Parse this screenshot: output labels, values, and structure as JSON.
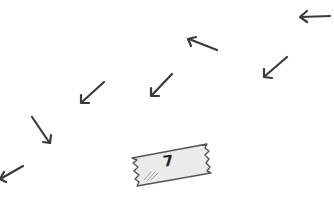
{
  "scene": {
    "background_color": "#ffffff",
    "stroke_color": "#3a3a3a",
    "tape_fill_color": "#ebebeb",
    "tape_outline_color": "#555555"
  },
  "arrows": [
    {
      "id": "arrow-1",
      "direction": "left",
      "x1": 330,
      "y1": 16,
      "x2": 300,
      "y2": 16
    },
    {
      "id": "arrow-2",
      "direction": "up-left",
      "x1": 217,
      "y1": 50,
      "x2": 188,
      "y2": 39
    },
    {
      "id": "arrow-3",
      "direction": "down-left",
      "x1": 287,
      "y1": 57,
      "x2": 264,
      "y2": 77
    },
    {
      "id": "arrow-4",
      "direction": "down-left",
      "x1": 172,
      "y1": 74,
      "x2": 151,
      "y2": 96
    },
    {
      "id": "arrow-5",
      "direction": "down-left",
      "x1": 104,
      "y1": 82,
      "x2": 81,
      "y2": 103
    },
    {
      "id": "arrow-6",
      "direction": "down-right",
      "x1": 32,
      "y1": 117,
      "x2": 50,
      "y2": 143
    },
    {
      "id": "arrow-7",
      "direction": "down-left",
      "x1": 23,
      "y1": 166,
      "x2": 0,
      "y2": 179
    }
  ],
  "tape": {
    "label": "7"
  }
}
